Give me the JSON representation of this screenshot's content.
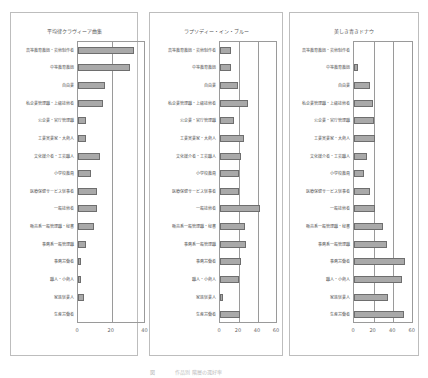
{
  "categories": [
    "高等教育教師・芸術制作者",
    "中等教育教師",
    "自由業",
    "私企業管理職・上級技術者",
    "公企業・官庁管理職",
    "工業実業家・大商人",
    "文化媒介者・工芸職人",
    "小学校教員",
    "医療保健サービス従事者",
    "一般技術者",
    "販売系一般管理職・秘書",
    "事務系一般管理職",
    "事務労働者",
    "職人・小商人",
    "家族従業人",
    "生産労働者"
  ],
  "chart_data": [
    {
      "type": "bar",
      "orientation": "horizontal",
      "title": "平均律クラヴィーア曲集",
      "categories": [
        "高等教育教師・芸術制作者",
        "中等教育教師",
        "自由業",
        "私企業管理職・上級技術者",
        "公企業・官庁管理職",
        "工業実業家・大商人",
        "文化媒介者・工芸職人",
        "小学校教員",
        "医療保健サービス従事者",
        "一般技術者",
        "販売系一般管理職・秘書",
        "事務系一般管理職",
        "事務労働者",
        "職人・小商人",
        "家族従業人",
        "生産労働者"
      ],
      "values": [
        33,
        31,
        16,
        15,
        5,
        4.5,
        13,
        7.5,
        11,
        11,
        9.5,
        5,
        1.5,
        2,
        3.5,
        0
      ],
      "xlim": [
        0,
        40
      ],
      "xticks": [
        "0",
        "20",
        "40"
      ],
      "grid": true
    },
    {
      "type": "bar",
      "orientation": "horizontal",
      "title": "ラプソディー・イン・ブルー",
      "categories": [
        "高等教育教師・芸術制作者",
        "中等教育教師",
        "自由業",
        "私企業管理職・上級技術者",
        "公企業・官庁管理職",
        "工業実業家・大商人",
        "文化媒介者・工芸職人",
        "小学校教員",
        "医療保健サービス従事者",
        "一般技術者",
        "販売系一般管理職・秘書",
        "事務系一般管理職",
        "事務労働者",
        "職人・小商人",
        "家族従業人",
        "生産労働者"
      ],
      "values": [
        12,
        12,
        19,
        29,
        15,
        25,
        22,
        20,
        20,
        42,
        26,
        27,
        22,
        20,
        3,
        21
      ],
      "xlim": [
        0,
        60
      ],
      "xticks": [
        "0",
        "20",
        "40",
        "60"
      ],
      "grid": true
    },
    {
      "type": "bar",
      "orientation": "horizontal",
      "title": "美しき青きドナウ",
      "categories": [
        "高等教育教師・芸術制作者",
        "中等教育教師",
        "自由業",
        "私企業管理職・上級技術者",
        "公企業・官庁管理職",
        "工業実業家・大商人",
        "文化媒介者・工芸職人",
        "小学校教員",
        "医療保健サービス従事者",
        "一般技術者",
        "販売系一般管理職・秘書",
        "事務系一般管理職",
        "事務労働者",
        "職人・小商人",
        "家族従業人",
        "生産労働者"
      ],
      "values": [
        0,
        4,
        16,
        19,
        20,
        21,
        13,
        10,
        16,
        21,
        30,
        34,
        52,
        49,
        35,
        51
      ],
      "xlim": [
        0,
        60
      ],
      "xticks": [
        "0",
        "20",
        "40",
        "60"
      ],
      "grid": true
    }
  ],
  "caption": "図　　　　作品別 階層の選好率"
}
